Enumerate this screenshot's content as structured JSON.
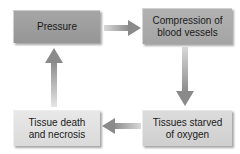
{
  "diagram": {
    "type": "cycle",
    "nodes": [
      {
        "id": "pressure",
        "label_line1": "Pressure",
        "label_line2": "",
        "color": "#9e9e9e"
      },
      {
        "id": "compression",
        "label_line1": "Compression of",
        "label_line2": "blood vessels",
        "color": "#ababab"
      },
      {
        "id": "starved",
        "label_line1": "Tissues starved",
        "label_line2": "of oxygen",
        "color": "#d5d5d5"
      },
      {
        "id": "necrosis",
        "label_line1": "Tissue death",
        "label_line2": "and necrosis",
        "color": "#e1e1e1"
      }
    ],
    "edges": [
      {
        "from": "pressure",
        "to": "compression",
        "direction": "right"
      },
      {
        "from": "compression",
        "to": "starved",
        "direction": "down"
      },
      {
        "from": "starved",
        "to": "necrosis",
        "direction": "left"
      },
      {
        "from": "necrosis",
        "to": "pressure",
        "direction": "up"
      }
    ],
    "arrow_color": "#8a8a8a"
  }
}
